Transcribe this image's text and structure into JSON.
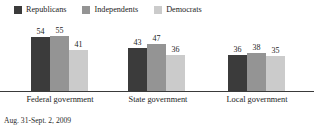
{
  "legend": {
    "items": [
      {
        "label": "Republicans",
        "color": "#3b3b3b"
      },
      {
        "label": "Independents",
        "color": "#949494"
      },
      {
        "label": "Democrats",
        "color": "#cbcbcb"
      }
    ]
  },
  "footnote": "Aug. 31-Sept. 2, 2009",
  "chart_data": {
    "type": "bar",
    "title": "",
    "subtitle": "",
    "xlabel": "",
    "ylabel": "",
    "ylim": [
      0,
      60
    ],
    "grid": false,
    "legend_position": "top-left",
    "categories": [
      "Federal government",
      "State government",
      "Local government"
    ],
    "series": [
      {
        "name": "Republicans",
        "color": "#3b3b3b",
        "values": [
          54,
          43,
          36
        ]
      },
      {
        "name": "Independents",
        "color": "#949494",
        "values": [
          55,
          47,
          38
        ]
      },
      {
        "name": "Democrats",
        "color": "#cbcbcb",
        "values": [
          41,
          36,
          35
        ]
      }
    ]
  }
}
